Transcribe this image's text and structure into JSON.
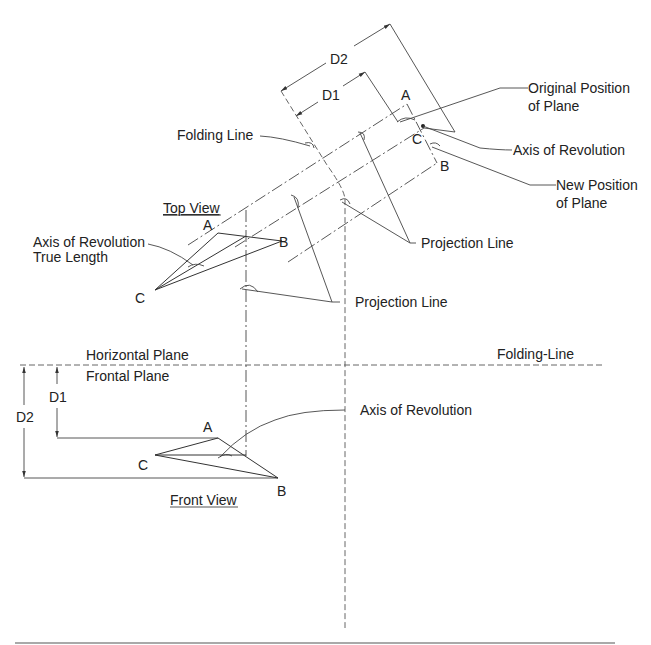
{
  "diagram": {
    "type": "descriptive-geometry",
    "dimensions": {
      "upper_d2": "D2",
      "upper_d1": "D1",
      "front_d1": "D1",
      "front_d2": "D2"
    },
    "labels": {
      "original_position_line1": "Original Position",
      "original_position_line2": "of Plane",
      "axis_of_revolution_aux": "Axis of Revolution",
      "new_position_line1": "New Position",
      "new_position_line2": "of Plane",
      "folding_line_aux": "Folding Line",
      "projection_line_1": "Projection Line",
      "projection_line_2": "Projection Line",
      "top_view": "Top View",
      "axis_true_length_line1": "Axis of Revolution",
      "axis_true_length_line2": "True Length",
      "horizontal_plane": "Horizontal Plane",
      "frontal_plane": "Frontal Plane",
      "folding_line_hf": "Folding-Line",
      "axis_of_revolution_front": "Axis of Revolution",
      "front_view": "Front View"
    },
    "points": {
      "aux_a": "A",
      "aux_c": "C",
      "aux_b": "B",
      "top_a": "A",
      "top_b": "B",
      "top_c": "C",
      "front_a": "A",
      "front_b": "B",
      "front_c": "C"
    }
  }
}
